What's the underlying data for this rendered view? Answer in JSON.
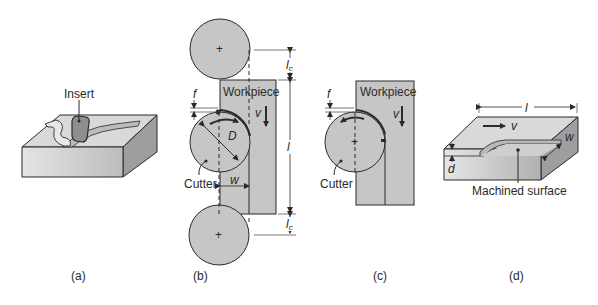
{
  "figure": {
    "panels": [
      {
        "id": "a",
        "caption": "(a)",
        "labels": {
          "insert": "Insert"
        }
      },
      {
        "id": "b",
        "caption": "(b)",
        "labels": {
          "workpiece": "Workpiece",
          "cutter": "Cutter",
          "feed": "f",
          "velocity": "v",
          "diameter": "D",
          "width": "w",
          "length": "l",
          "approach_top": "lc",
          "approach_bottom": "lc"
        }
      },
      {
        "id": "c",
        "caption": "(c)",
        "labels": {
          "workpiece": "Workpiece",
          "cutter": "Cutter",
          "feed": "f",
          "velocity": "v"
        }
      },
      {
        "id": "d",
        "caption": "(d)",
        "labels": {
          "length": "l",
          "velocity": "v",
          "width": "w",
          "depth": "d",
          "machined_surface": "Machined surface"
        }
      }
    ],
    "colors": {
      "fill_gray": "#c8c8c8",
      "fill_light": "#dedede",
      "fill_dark": "#9a9a9a",
      "stroke": "#2a2a2a",
      "dim_line": "#555555"
    }
  }
}
